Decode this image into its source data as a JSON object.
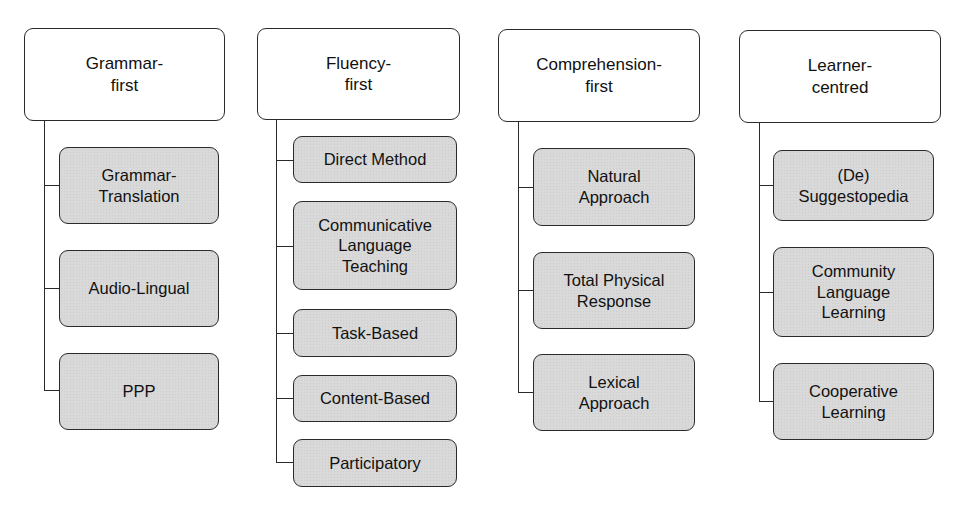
{
  "diagram": {
    "columns": [
      {
        "header": "Grammar-\nfirst",
        "children": [
          "Grammar-\nTranslation",
          "Audio-Lingual",
          "PPP"
        ]
      },
      {
        "header": "Fluency-\nfirst",
        "children": [
          "Direct Method",
          "Communicative\nLanguage\nTeaching",
          "Task-Based",
          "Content-Based",
          "Participatory"
        ]
      },
      {
        "header": "Comprehension-\nfirst",
        "children": [
          "Natural\nApproach",
          "Total Physical\nResponse",
          "Lexical\nApproach"
        ]
      },
      {
        "header": "Learner-\ncentred",
        "children": [
          "(De)\nSuggestopedia",
          "Community\nLanguage\nLearning",
          "Cooperative\nLearning"
        ]
      }
    ]
  },
  "colors": {
    "header_fill": "#ffffff",
    "child_fill": "#d9d9d9",
    "stroke": "#2a2a2a"
  }
}
